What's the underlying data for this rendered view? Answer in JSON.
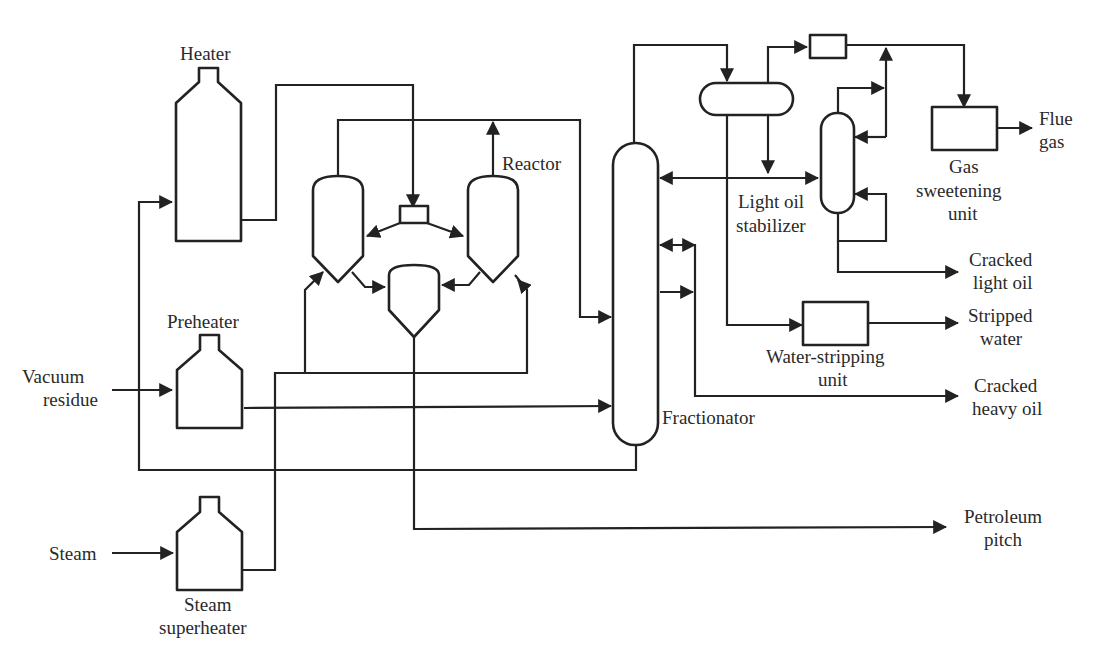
{
  "diagram": {
    "type": "process-flow-diagram",
    "colors": {
      "line": "#222222",
      "text": "#2a2a2a",
      "background": "#ffffff"
    },
    "inputs": {
      "vacuum_residue": [
        "Vacuum",
        "residue"
      ],
      "steam": [
        "Steam"
      ]
    },
    "equipment": {
      "heater": [
        "Heater"
      ],
      "preheater": [
        "Preheater"
      ],
      "steam_superheater": [
        "Steam",
        "superheater"
      ],
      "reactor": [
        "Reactor"
      ],
      "fractionator": [
        "Fractionator"
      ],
      "light_oil_stabilizer": [
        "Light oil",
        "stabilizer"
      ],
      "gas_sweetening_unit": [
        "Gas",
        "sweetening",
        "unit"
      ],
      "water_stripping_unit": [
        "Water-stripping",
        "unit"
      ]
    },
    "outputs": {
      "flue_gas": [
        "Flue",
        "gas"
      ],
      "cracked_light_oil": [
        "Cracked",
        "light oil"
      ],
      "stripped_water": [
        "Stripped",
        "water"
      ],
      "cracked_heavy_oil": [
        "Cracked",
        "heavy oil"
      ],
      "petroleum_pitch": [
        "Petroleum",
        "pitch"
      ]
    }
  }
}
